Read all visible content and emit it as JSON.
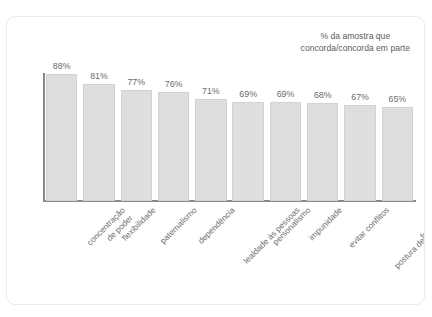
{
  "title_sliver": "…",
  "legend": {
    "line1": "% da amostra que",
    "line2": "concorda/concorda em parte"
  },
  "chart_data": {
    "type": "bar",
    "title": "",
    "subtitle": "",
    "xlabel": "",
    "ylabel": "",
    "ylim": [
      0,
      100
    ],
    "grid": false,
    "legend_position": "top-right",
    "legend_entries": [
      "% da amostra que concorda/concorda em parte"
    ],
    "value_suffix": "%",
    "bar_color": "#dedede",
    "bar_border_color": "#d2d2d2",
    "axis_color": "#8a8a8a",
    "label_color": "#6b6b6b",
    "categories": [
      "concentração de poder",
      "flexibilidade",
      "paternalismo",
      "dependência",
      "lealdade às pessoas",
      "personalismo",
      "impunidade",
      "evitar conflitos",
      "postura de espectador",
      "formalismo"
    ],
    "category_lines": [
      [
        "concentração",
        "de poder"
      ],
      [
        "flexibilidade"
      ],
      [
        "paternalismo"
      ],
      [
        "dependência"
      ],
      [
        "lealdade às pessoas"
      ],
      [
        "personalismo"
      ],
      [
        "impunidade"
      ],
      [
        "evitar conflitos"
      ],
      [
        "postura de espectador"
      ],
      [
        "formalismo"
      ]
    ],
    "values": [
      88,
      81,
      77,
      76,
      71,
      69,
      69,
      68,
      67,
      65
    ],
    "data_labels": [
      "88%",
      "81%",
      "77%",
      "76%",
      "71%",
      "69%",
      "69%",
      "68%",
      "67%",
      "65%"
    ]
  }
}
